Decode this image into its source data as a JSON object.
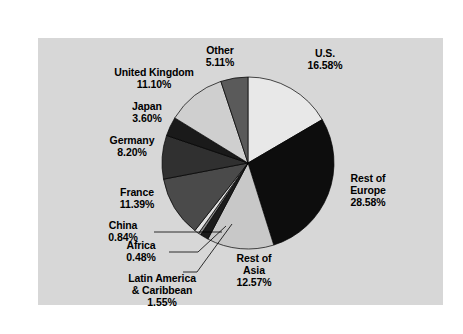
{
  "figure": {
    "panel_background": "#d7d7d7",
    "page_background": "#ffffff"
  },
  "chart_data": {
    "type": "pie",
    "title": "",
    "subtitle": "",
    "xlabel": "",
    "ylabel": "",
    "legend_position": "none",
    "grid": false,
    "value_unit": "percent",
    "total": 100.0,
    "categories": [
      "U.S.",
      "Rest of Europe",
      "Rest of Asia",
      "Latin America & Caribbean",
      "Africa",
      "China",
      "France",
      "Germany",
      "Japan",
      "United Kingdom",
      "Other"
    ],
    "values": [
      16.58,
      28.58,
      12.57,
      1.55,
      0.48,
      0.84,
      11.39,
      8.2,
      3.6,
      11.1,
      5.11
    ],
    "slices": [
      {
        "label": "U.S.",
        "value": 16.58,
        "value_text": "16.58%",
        "color": "#e8e8e8"
      },
      {
        "label": "Rest of Europe",
        "value": 28.58,
        "value_text": "28.58%",
        "color": "#0d0d0d"
      },
      {
        "label": "Rest of Asia",
        "value": 12.57,
        "value_text": "12.57%",
        "color": "#c8c8c8"
      },
      {
        "label": "Latin America & Caribbean",
        "value": 1.55,
        "value_text": "1.55%",
        "color": "#1c1c1c"
      },
      {
        "label": "Africa",
        "value": 0.48,
        "value_text": "0.48%",
        "color": "#8a8a8a"
      },
      {
        "label": "China",
        "value": 0.84,
        "value_text": "0.84%",
        "color": "#e0e0e0"
      },
      {
        "label": "France",
        "value": 11.39,
        "value_text": "11.39%",
        "color": "#4a4a4a"
      },
      {
        "label": "Germany",
        "value": 8.2,
        "value_text": "8.20%",
        "color": "#303030"
      },
      {
        "label": "Japan",
        "value": 3.6,
        "value_text": "3.60%",
        "color": "#1a1a1a"
      },
      {
        "label": "United Kingdom",
        "value": 11.1,
        "value_text": "11.10%",
        "color": "#cfcfcf"
      },
      {
        "label": "Other",
        "value": 5.11,
        "value_text": "5.11%",
        "color": "#5a5a5a"
      }
    ]
  },
  "labels": {
    "other": {
      "name": "Other",
      "pct": "5.11%"
    },
    "us": {
      "name": "U.S.",
      "pct": "16.58%"
    },
    "united_kingdom": {
      "name": "United Kingdom",
      "pct": "11.10%"
    },
    "japan": {
      "name": "Japan",
      "pct": "3.60%"
    },
    "germany": {
      "name": "Germany",
      "pct": "8.20%"
    },
    "france": {
      "name": "France",
      "pct": "11.39%"
    },
    "china": {
      "name": "China",
      "pct": "0.84%"
    },
    "africa": {
      "name": "Africa",
      "pct": "0.48%"
    },
    "latin_america": {
      "name_line1": "Latin America",
      "name_line2": "& Caribbean",
      "pct": "1.55%"
    },
    "rest_of_asia": {
      "name_line1": "Rest of",
      "name_line2": "Asia",
      "pct": "12.57%"
    },
    "rest_of_europe": {
      "name_line1": "Rest of",
      "name_line2": "Europe",
      "pct": "28.58%"
    }
  }
}
